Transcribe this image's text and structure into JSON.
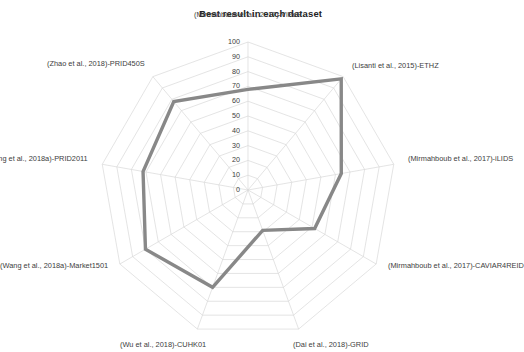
{
  "chart_data": {
    "type": "radar",
    "title": "Best result in each dataset",
    "xlabel": "",
    "ylabel": "",
    "grid": true,
    "legend": "none",
    "rlim": [
      0,
      100
    ],
    "rticks": [
      "100",
      "90",
      "80",
      "70",
      "60",
      "50",
      "40",
      "30",
      "20",
      "10",
      "0"
    ],
    "categories": [
      "(Mirmahboub et al., 2017)-ViPeR",
      "(Lisanti et al., 2015)-ETHZ",
      "(Mirmahboub et al., 2017)-iLIDS",
      "(Mirmahboub et al., 2017)-CAVIAR4REID",
      "(Dai et al., 2018)-GRID",
      "(Wu et al., 2018)-CUHK01",
      "(Wang et al., 2018a)-Market1501",
      "(Wang et al., 2018a)-PRID2011",
      "(Zhao et al., 2018)-PRID450S"
    ],
    "values": [
      68,
      98,
      64,
      52,
      29,
      70,
      80,
      72,
      78
    ],
    "series": [
      {
        "name": "Best result",
        "values": [
          68,
          98,
          64,
          52,
          29,
          70,
          80,
          72,
          78
        ]
      }
    ],
    "line_color": "#888888",
    "grid_color": "#d9d9d9"
  },
  "axis_labels": [
    {
      "text": "(Mirmahboub et al., 2017)-ViPeR"
    },
    {
      "text": "(Lisanti et al., 2015)-ETHZ"
    },
    {
      "text": "(Mirmahboub et al., 2017)-iLIDS"
    },
    {
      "text": "(Mirmahboub et al., 2017)-CAVIAR4REID"
    },
    {
      "text": "(Dai et al., 2018)-GRID"
    },
    {
      "text": "(Wu et al., 2018)-CUHK01"
    },
    {
      "text": "(Wang et al., 2018a)-Market1501"
    },
    {
      "text": "(Wang et al., 2018a)-PRID2011"
    },
    {
      "text": "(Zhao et al., 2018)-PRID450S"
    }
  ],
  "radial_ticks": [
    {
      "text": "100"
    },
    {
      "text": "90"
    },
    {
      "text": "80"
    },
    {
      "text": "70"
    },
    {
      "text": "60"
    },
    {
      "text": "50"
    },
    {
      "text": "40"
    },
    {
      "text": "30"
    },
    {
      "text": "20"
    },
    {
      "text": "10"
    },
    {
      "text": "0"
    }
  ]
}
